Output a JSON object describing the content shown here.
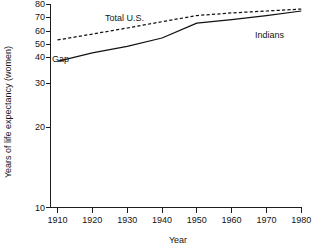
{
  "chart_data": {
    "type": "line",
    "title": "",
    "xlabel": "Year",
    "ylabel": "Years of life expectancy (women)",
    "xlim": [
      1910,
      1980
    ],
    "ylim": [
      10,
      80
    ],
    "xticks": [
      1910,
      1920,
      1930,
      1940,
      1950,
      1960,
      1970,
      1980
    ],
    "yticks": [
      10,
      20,
      30,
      40,
      50,
      60,
      70,
      80
    ],
    "grid": false,
    "legend_position": "inline-annotations",
    "y_axis_note": "Non-linear vertical scale: spacing between 40,50,60,70,80 is compressed relative to 10,20,30,40",
    "x": [
      1910,
      1920,
      1930,
      1940,
      1950,
      1960,
      1970,
      1980
    ],
    "series": [
      {
        "name": "Total U.S.",
        "style": "dashed",
        "values": [
          53.5,
          58.0,
          62.5,
          67.0,
          71.5,
          73.5,
          75.0,
          76.5
        ]
      },
      {
        "name": "Indians",
        "style": "solid",
        "values": [
          38.5,
          43.5,
          48.5,
          55.0,
          66.0,
          68.5,
          71.5,
          75.0
        ]
      }
    ],
    "annotations": [
      {
        "text": "Total  U.S.",
        "name": "total-us-label",
        "x_px": 105,
        "y_px": 21
      },
      {
        "text": "Gap",
        "name": "gap-label",
        "x_px": 52,
        "y_px": 62
      },
      {
        "text": "Indians",
        "name": "indians-label",
        "x_px": 255,
        "y_px": 38
      }
    ]
  },
  "axes": {
    "y_title": "Years of life expectancy (women)",
    "x_title": "Year",
    "y_tick_labels": [
      "80",
      "70",
      "60",
      "50",
      "40",
      "30",
      "20",
      "10"
    ],
    "x_tick_labels": [
      "1910",
      "1920",
      "1930",
      "1940",
      "1950",
      "1960",
      "1970",
      "1980"
    ]
  }
}
